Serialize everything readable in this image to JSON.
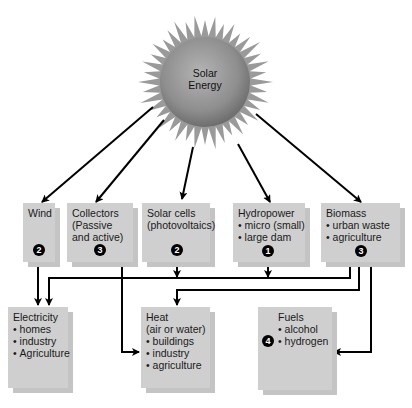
{
  "sun": {
    "label_line1": "Solar",
    "label_line2": "Energy"
  },
  "sources": [
    {
      "id": "wind",
      "title": "Wind",
      "lines": [],
      "items": [],
      "badge": "2"
    },
    {
      "id": "collectors",
      "title": "Collectors",
      "lines": [
        "(Passive",
        "and active)"
      ],
      "items": [],
      "badge": "3"
    },
    {
      "id": "solar-cells",
      "title": "Solar cells",
      "lines": [
        "(photovoltaics)"
      ],
      "items": [],
      "badge": "2"
    },
    {
      "id": "hydropower",
      "title": "Hydropower",
      "lines": [],
      "items": [
        "micro (small)",
        "large dam"
      ],
      "badge": "1"
    },
    {
      "id": "biomass",
      "title": "Biomass",
      "lines": [],
      "items": [
        "urban waste",
        "agriculture"
      ],
      "badge": "3"
    }
  ],
  "outputs": [
    {
      "id": "electricity",
      "title": "Electricity",
      "lines": [],
      "items": [
        "homes",
        "industry",
        "Agriculture"
      ]
    },
    {
      "id": "heat",
      "title": "Heat",
      "lines": [
        "(air or water)"
      ],
      "items": [
        "buildings",
        "industry",
        "agriculture"
      ]
    },
    {
      "id": "fuels",
      "title": "Fuels",
      "lines": [],
      "items": [
        "alcohol",
        "hydrogen"
      ],
      "badge": "4"
    }
  ],
  "colors": {
    "box_fill": "#cfcfcf",
    "box_shadow": "#c2c2c2",
    "sun_core": "#8c8c8c",
    "sun_rays": "#9a9a9a",
    "arrow": "#000000",
    "badge": "#000000"
  }
}
